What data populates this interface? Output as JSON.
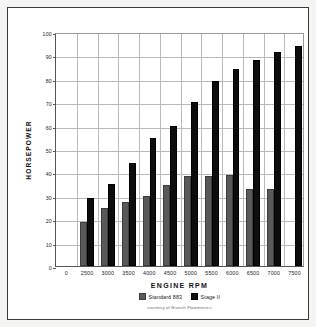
{
  "chart_data": {
    "type": "bar",
    "title": "",
    "xlabel": "ENGINE RPM",
    "ylabel": "HORSEPOWER",
    "categories": [
      "0",
      "2500",
      "3000",
      "3500",
      "4000",
      "4500",
      "5000",
      "5500",
      "6000",
      "6500",
      "7000",
      "7500"
    ],
    "series": [
      {
        "name": "Standard 883",
        "color": "#595959",
        "values": [
          null,
          19,
          25,
          27.5,
          30,
          34.5,
          38.5,
          38.5,
          39,
          33,
          33,
          null
        ]
      },
      {
        "name": "Stage II",
        "color": "#0d0d0d",
        "values": [
          null,
          29,
          35,
          44,
          54.5,
          60,
          70,
          79,
          84,
          88,
          91.5,
          94
        ]
      }
    ],
    "ylim": [
      0,
      100
    ],
    "yticks": [
      0,
      10,
      20,
      30,
      40,
      50,
      60,
      70,
      80,
      90,
      100
    ],
    "grid": true,
    "legend_position": "bottom",
    "annotation": "courtesy of Branch Flowmetrics"
  }
}
